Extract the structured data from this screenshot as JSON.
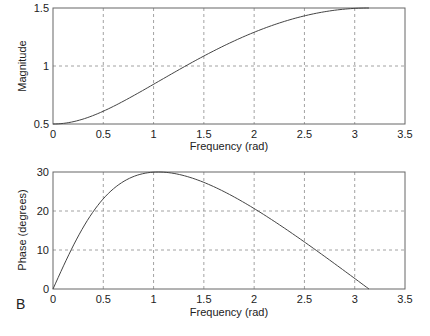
{
  "chart_data": [
    {
      "type": "line",
      "title": "",
      "xlabel": "Frequency (rad)",
      "ylabel": "Magnitude",
      "xlim": [
        0,
        3.5
      ],
      "ylim": [
        0.5,
        1.5
      ],
      "xticks": [
        "0",
        "0.5",
        "1",
        "1.5",
        "2",
        "2.5",
        "3",
        "3.5"
      ],
      "yticks": [
        "0.5",
        "1",
        "1.5"
      ],
      "grid": true,
      "series": [
        {
          "name": "Magnitude",
          "x": [
            0,
            0.25,
            0.5,
            0.75,
            1.0,
            1.25,
            1.5,
            1.75,
            2.0,
            2.25,
            2.5,
            2.75,
            3.0,
            3.1416
          ],
          "y": [
            0.5,
            0.52,
            0.58,
            0.69,
            0.82,
            0.95,
            1.07,
            1.19,
            1.29,
            1.37,
            1.44,
            1.48,
            1.5,
            1.5
          ]
        }
      ]
    },
    {
      "type": "line",
      "title": "",
      "xlabel": "Frequency (rad)",
      "ylabel": "Phase (degrees)",
      "xlim": [
        0,
        3.5
      ],
      "ylim": [
        0,
        30
      ],
      "xticks": [
        "0",
        "0.5",
        "1",
        "1.5",
        "2",
        "2.5",
        "3",
        "3.5"
      ],
      "yticks": [
        "0",
        "10",
        "20",
        "30"
      ],
      "grid": true,
      "series": [
        {
          "name": "Phase",
          "x": [
            0,
            0.25,
            0.5,
            0.75,
            1.0,
            1.25,
            1.5,
            1.75,
            2.0,
            2.25,
            2.5,
            2.75,
            3.0,
            3.1416
          ],
          "y": [
            0,
            13.6,
            23.9,
            28.8,
            30.0,
            28.9,
            26.3,
            22.9,
            19.1,
            14.8,
            10.3,
            5.7,
            1.9,
            0
          ]
        }
      ]
    }
  ],
  "panel_label": "B",
  "top": {
    "ylabel": "Magnitude",
    "xlabel": "Frequency (rad)"
  },
  "bottom": {
    "ylabel": "Phase (degrees)",
    "xlabel": "Frequency (rad)"
  },
  "colors": {
    "axis": "#555555",
    "grid": "#8a8a8a",
    "line": "#444444"
  }
}
